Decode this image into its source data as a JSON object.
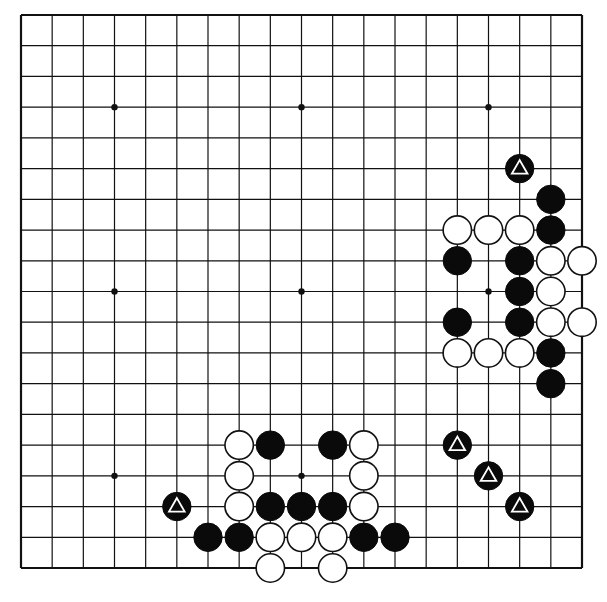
{
  "diagram": {
    "type": "go-board-diagram",
    "size": 19,
    "colors": {
      "line": "#111111",
      "black_stone": "#0a0a0a",
      "white_stone": "#ffffff",
      "background": "#ffffff",
      "triangle_mark": "#ffffff"
    },
    "star_points": [
      [
        3,
        3
      ],
      [
        9,
        3
      ],
      [
        15,
        3
      ],
      [
        3,
        9
      ],
      [
        9,
        9
      ],
      [
        15,
        9
      ],
      [
        3,
        15
      ],
      [
        9,
        15
      ],
      [
        15,
        15
      ]
    ],
    "black_stones": [
      {
        "col": 16,
        "row": 5,
        "mark": "triangle"
      },
      {
        "col": 17,
        "row": 6
      },
      {
        "col": 17,
        "row": 7
      },
      {
        "col": 14,
        "row": 8
      },
      {
        "col": 16,
        "row": 8
      },
      {
        "col": 16,
        "row": 9
      },
      {
        "col": 14,
        "row": 10
      },
      {
        "col": 16,
        "row": 10
      },
      {
        "col": 17,
        "row": 11
      },
      {
        "col": 17,
        "row": 12
      },
      {
        "col": 8,
        "row": 14
      },
      {
        "col": 10,
        "row": 14
      },
      {
        "col": 14,
        "row": 14,
        "mark": "triangle"
      },
      {
        "col": 15,
        "row": 15,
        "mark": "triangle"
      },
      {
        "col": 5,
        "row": 16,
        "mark": "triangle"
      },
      {
        "col": 8,
        "row": 16
      },
      {
        "col": 9,
        "row": 16
      },
      {
        "col": 10,
        "row": 16
      },
      {
        "col": 16,
        "row": 16,
        "mark": "triangle"
      },
      {
        "col": 6,
        "row": 17
      },
      {
        "col": 7,
        "row": 17
      },
      {
        "col": 11,
        "row": 17
      },
      {
        "col": 12,
        "row": 17
      }
    ],
    "white_stones": [
      {
        "col": 14,
        "row": 7
      },
      {
        "col": 15,
        "row": 7
      },
      {
        "col": 16,
        "row": 7
      },
      {
        "col": 17,
        "row": 8
      },
      {
        "col": 18,
        "row": 8
      },
      {
        "col": 17,
        "row": 9
      },
      {
        "col": 17,
        "row": 10
      },
      {
        "col": 18,
        "row": 10
      },
      {
        "col": 14,
        "row": 11
      },
      {
        "col": 15,
        "row": 11
      },
      {
        "col": 16,
        "row": 11
      },
      {
        "col": 7,
        "row": 14
      },
      {
        "col": 11,
        "row": 14
      },
      {
        "col": 7,
        "row": 15
      },
      {
        "col": 11,
        "row": 15
      },
      {
        "col": 7,
        "row": 16
      },
      {
        "col": 11,
        "row": 16
      },
      {
        "col": 8,
        "row": 17
      },
      {
        "col": 9,
        "row": 17
      },
      {
        "col": 10,
        "row": 17
      },
      {
        "col": 8,
        "row": 18
      },
      {
        "col": 10,
        "row": 18
      }
    ]
  }
}
